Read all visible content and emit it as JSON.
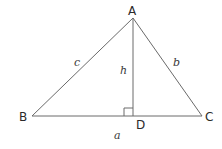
{
  "diagram": {
    "type": "triangle-with-altitude",
    "stroke_color": "#6a6a6a",
    "vertices": {
      "A": {
        "label": "A",
        "x": 133,
        "y": 18
      },
      "B": {
        "label": "B",
        "x": 32,
        "y": 116
      },
      "C": {
        "label": "C",
        "x": 202,
        "y": 116
      },
      "D": {
        "label": "D",
        "x": 133,
        "y": 116
      }
    },
    "sides": {
      "a": {
        "label": "a"
      },
      "b": {
        "label": "b"
      },
      "c": {
        "label": "c"
      },
      "h": {
        "label": "h"
      }
    },
    "right_angle_marker_at": "D"
  }
}
